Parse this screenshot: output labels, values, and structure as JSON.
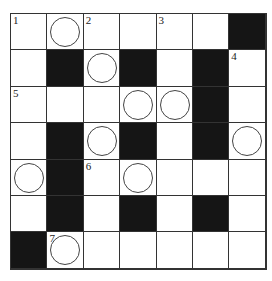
{
  "puzzle": {
    "type": "crossword",
    "rows": 7,
    "cols": 7,
    "cells": [
      [
        {
          "t": "w",
          "n": "1"
        },
        {
          "t": "o"
        },
        {
          "t": "w",
          "n": "2"
        },
        {
          "t": "w"
        },
        {
          "t": "w",
          "n": "3"
        },
        {
          "t": "w"
        },
        {
          "t": "b"
        }
      ],
      [
        {
          "t": "w"
        },
        {
          "t": "b"
        },
        {
          "t": "o"
        },
        {
          "t": "b"
        },
        {
          "t": "w"
        },
        {
          "t": "b"
        },
        {
          "t": "w",
          "n": "4"
        }
      ],
      [
        {
          "t": "w",
          "n": "5"
        },
        {
          "t": "w"
        },
        {
          "t": "w"
        },
        {
          "t": "o"
        },
        {
          "t": "o"
        },
        {
          "t": "b"
        },
        {
          "t": "w"
        }
      ],
      [
        {
          "t": "w"
        },
        {
          "t": "b"
        },
        {
          "t": "o"
        },
        {
          "t": "b"
        },
        {
          "t": "w"
        },
        {
          "t": "b"
        },
        {
          "t": "o"
        }
      ],
      [
        {
          "t": "o"
        },
        {
          "t": "b"
        },
        {
          "t": "w",
          "n": "6"
        },
        {
          "t": "o"
        },
        {
          "t": "w"
        },
        {
          "t": "w"
        },
        {
          "t": "w"
        }
      ],
      [
        {
          "t": "w"
        },
        {
          "t": "b"
        },
        {
          "t": "w"
        },
        {
          "t": "b"
        },
        {
          "t": "w"
        },
        {
          "t": "b"
        },
        {
          "t": "w"
        }
      ],
      [
        {
          "t": "b"
        },
        {
          "t": "o",
          "n": "7"
        },
        {
          "t": "w"
        },
        {
          "t": "w"
        },
        {
          "t": "w"
        },
        {
          "t": "w"
        },
        {
          "t": "w"
        }
      ]
    ]
  }
}
